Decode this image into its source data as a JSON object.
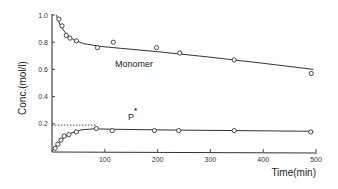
{
  "chart_data": {
    "type": "scatter",
    "title": "",
    "xlabel": "Time(min)",
    "ylabel": "Conc.(mol/l)",
    "xlim": [
      0,
      500
    ],
    "ylim": [
      0,
      1.0
    ],
    "xticks": [
      100,
      200,
      300,
      400,
      500
    ],
    "xtick_labels": [
      "100",
      "200",
      "300",
      "400",
      "500"
    ],
    "yticks": [
      0.2,
      0.4,
      0.6,
      0.8,
      1.0
    ],
    "ytick_labels": [
      "0.2",
      "0.4",
      "0.6",
      "0.8",
      "1.0"
    ],
    "grid": false,
    "legend": "none (inline series labels)",
    "series": [
      {
        "name": "Monomer",
        "label": "Monomer",
        "marker": "open-circle",
        "points": [
          {
            "x": 13,
            "y": 0.97
          },
          {
            "x": 19,
            "y": 0.92
          },
          {
            "x": 27,
            "y": 0.85
          },
          {
            "x": 34,
            "y": 0.83
          },
          {
            "x": 46,
            "y": 0.81
          },
          {
            "x": 86,
            "y": 0.76
          },
          {
            "x": 116,
            "y": 0.8
          },
          {
            "x": 198,
            "y": 0.76
          },
          {
            "x": 242,
            "y": 0.72
          },
          {
            "x": 345,
            "y": 0.67
          },
          {
            "x": 491,
            "y": 0.57
          }
        ],
        "fit_curve": [
          {
            "x": 8,
            "y": 1.0
          },
          {
            "x": 15,
            "y": 0.93
          },
          {
            "x": 25,
            "y": 0.87
          },
          {
            "x": 40,
            "y": 0.82
          },
          {
            "x": 60,
            "y": 0.79
          },
          {
            "x": 90,
            "y": 0.77
          },
          {
            "x": 130,
            "y": 0.755
          },
          {
            "x": 200,
            "y": 0.73
          },
          {
            "x": 300,
            "y": 0.69
          },
          {
            "x": 400,
            "y": 0.645
          },
          {
            "x": 495,
            "y": 0.6
          }
        ]
      },
      {
        "name": "P*",
        "label": "P",
        "label_superscript": "*",
        "marker": "open-circle",
        "points": [
          {
            "x": 6,
            "y": 0.02
          },
          {
            "x": 11,
            "y": 0.05
          },
          {
            "x": 17,
            "y": 0.08
          },
          {
            "x": 23,
            "y": 0.11
          },
          {
            "x": 32,
            "y": 0.12
          },
          {
            "x": 46,
            "y": 0.14
          },
          {
            "x": 84,
            "y": 0.165
          },
          {
            "x": 114,
            "y": 0.15
          },
          {
            "x": 194,
            "y": 0.15
          },
          {
            "x": 240,
            "y": 0.15
          },
          {
            "x": 345,
            "y": 0.15
          },
          {
            "x": 490,
            "y": 0.14
          }
        ],
        "fit_curve": [
          {
            "x": 0,
            "y": 0.0
          },
          {
            "x": 10,
            "y": 0.05
          },
          {
            "x": 20,
            "y": 0.09
          },
          {
            "x": 35,
            "y": 0.13
          },
          {
            "x": 55,
            "y": 0.155
          },
          {
            "x": 80,
            "y": 0.163
          },
          {
            "x": 110,
            "y": 0.16
          },
          {
            "x": 200,
            "y": 0.155
          },
          {
            "x": 350,
            "y": 0.15
          },
          {
            "x": 495,
            "y": 0.145
          }
        ]
      }
    ],
    "annotations": [
      {
        "type": "dotted-hline",
        "y": 0.19,
        "x_from": 0,
        "x_to": 84
      }
    ]
  }
}
